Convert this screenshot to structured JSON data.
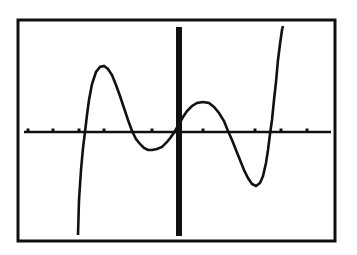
{
  "chart_data": {
    "type": "line",
    "title": "",
    "xlabel": "",
    "ylabel": "",
    "frame": {
      "x1": 18,
      "y1": 20,
      "x2": 335,
      "y2": 241
    },
    "axes": {
      "x_axis_y": 132,
      "y_axis_x": 179,
      "color": "#111111"
    },
    "x_ticks_px": [
      28,
      53,
      79,
      104,
      152,
      203,
      255,
      281,
      307
    ],
    "x_ticks_units": [
      -6,
      -5,
      -4,
      -3,
      -1,
      1,
      3,
      4,
      5
    ],
    "series": [
      {
        "name": "y1",
        "points_px": [
          [
            78,
            235
          ],
          [
            79,
            200
          ],
          [
            81,
            170
          ],
          [
            83,
            148
          ],
          [
            85,
            132
          ],
          [
            87,
            115
          ],
          [
            89,
            100
          ],
          [
            92,
            84
          ],
          [
            96,
            72
          ],
          [
            100,
            67
          ],
          [
            104,
            66
          ],
          [
            108,
            69
          ],
          [
            112,
            75
          ],
          [
            116,
            85
          ],
          [
            120,
            96
          ],
          [
            124,
            108
          ],
          [
            128,
            120
          ],
          [
            132,
            131
          ],
          [
            136,
            139
          ],
          [
            140,
            144
          ],
          [
            144,
            148
          ],
          [
            148,
            150
          ],
          [
            152,
            150
          ],
          [
            157,
            149
          ],
          [
            162,
            147
          ],
          [
            167,
            142
          ],
          [
            171,
            137
          ],
          [
            175,
            131
          ],
          [
            179,
            124
          ],
          [
            183,
            117
          ],
          [
            187,
            111
          ],
          [
            192,
            106
          ],
          [
            197,
            103
          ],
          [
            203,
            102
          ],
          [
            209,
            103
          ],
          [
            214,
            107
          ],
          [
            219,
            113
          ],
          [
            224,
            121
          ],
          [
            228,
            131
          ],
          [
            232,
            140
          ],
          [
            236,
            150
          ],
          [
            240,
            160
          ],
          [
            244,
            170
          ],
          [
            248,
            178
          ],
          [
            252,
            184
          ],
          [
            256,
            186
          ],
          [
            260,
            183
          ],
          [
            263,
            176
          ],
          [
            266,
            163
          ],
          [
            268,
            150
          ],
          [
            270,
            134
          ],
          [
            272,
            120
          ],
          [
            274,
            100
          ],
          [
            276,
            82
          ],
          [
            278,
            60
          ],
          [
            280,
            44
          ],
          [
            282,
            30
          ],
          [
            283,
            26
          ]
        ],
        "zeros_units": [
          -4.3,
          -2.3,
          0,
          2.0,
          3.8
        ]
      }
    ],
    "colors": {
      "background": "#ffffff",
      "ink": "#111111"
    }
  }
}
